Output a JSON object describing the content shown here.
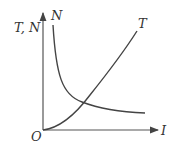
{
  "diagram": {
    "y_axis_label": "T, N",
    "x_axis_label": "I",
    "origin_label": "O",
    "curves": [
      {
        "name": "N",
        "label": "N",
        "shape": "decreasing hyperbola"
      },
      {
        "name": "T",
        "label": "T",
        "shape": "increasing parabola from origin"
      }
    ],
    "line_color": "#444444"
  }
}
